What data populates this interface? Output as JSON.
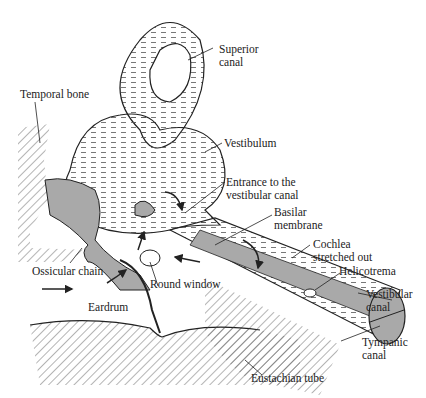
{
  "diagram": {
    "colors": {
      "line": "#222222",
      "fill_grey": "#a9a9a9",
      "background": "#ffffff"
    },
    "labels": {
      "superior_canal": [
        "Superior",
        "canal"
      ],
      "temporal_bone": "Temporal bone",
      "vestibulum": "Vestibulum",
      "entrance": [
        "Entrance to the",
        "vestibular canal"
      ],
      "basilar": [
        "Basilar",
        "membrane"
      ],
      "cochlea": [
        "Cochlea",
        "stretched out"
      ],
      "helicotrema": "Helicotrema",
      "ossicular_chain": "Ossicular chain",
      "round_window": "Round window",
      "vestibular_canal": [
        "Vestibular",
        "canal"
      ],
      "eardrum": "Eardrum",
      "tympanic_canal": [
        "Tympanic",
        "canal"
      ],
      "eustachian_tube": "Eustachian tube"
    }
  }
}
